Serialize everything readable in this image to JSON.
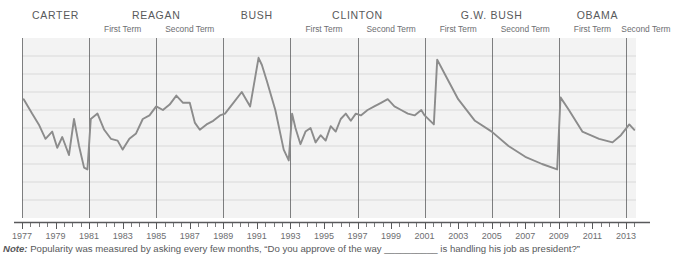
{
  "presidents": [
    {
      "name": "CARTER",
      "terms": []
    },
    {
      "name": "REAGAN",
      "terms": [
        "First Term",
        "Second Term"
      ]
    },
    {
      "name": "BUSH",
      "terms": []
    },
    {
      "name": "CLINTON",
      "terms": [
        "First Term",
        "Second Term"
      ]
    },
    {
      "name": "G.W. BUSH",
      "terms": [
        "First Term",
        "Second Term"
      ]
    },
    {
      "name": "OBAMA",
      "terms": [
        "First Term",
        "Second Term"
      ]
    }
  ],
  "note": {
    "label": "Note:",
    "text": "Popularity was measured by asking every few months, “Do you approve of the way __________ is handling his job as president?”"
  },
  "colors": {
    "line": "#8c8c8c",
    "plot_background": "#f3f3f3",
    "gridline": "#d9d9d9",
    "divider": "#58595b",
    "axis": "#58595b",
    "text": "#58595b"
  },
  "chart_data": {
    "type": "line",
    "title": "",
    "subtitle": "",
    "xlabel": "",
    "ylabel": "",
    "grid": true,
    "legend": "none",
    "xlim": [
      1977,
      2013.6
    ],
    "ylim": [
      0,
      100
    ],
    "xticks": [
      1977,
      1979,
      1981,
      1983,
      1985,
      1987,
      1989,
      1991,
      1993,
      1995,
      1997,
      1999,
      2001,
      2003,
      2005,
      2007,
      2009,
      2011,
      2013
    ],
    "xtick_labels": [
      "1977",
      "1979",
      "1981",
      "1983",
      "1985",
      "1987",
      "1989",
      "1991",
      "1993",
      "1995",
      "1997",
      "1999",
      "2001",
      "2003",
      "2005",
      "2007",
      "2009",
      "2011",
      "2013"
    ],
    "minor_tick_interval": 0.5,
    "term_boundaries": [
      1977,
      1981,
      1985,
      1989,
      1993,
      1997,
      2001,
      2005,
      2009,
      2013
    ],
    "series": [
      {
        "name": "Presidential approval rating",
        "x": [
          1977.1,
          1977.6,
          1978.0,
          1978.4,
          1978.8,
          1979.1,
          1979.4,
          1979.8,
          1980.1,
          1980.4,
          1980.7,
          1980.9,
          1981.1,
          1981.5,
          1981.9,
          1982.3,
          1982.7,
          1983.0,
          1983.4,
          1983.8,
          1984.2,
          1984.6,
          1985.0,
          1985.4,
          1985.8,
          1986.2,
          1986.6,
          1987.0,
          1987.3,
          1987.6,
          1988.0,
          1988.4,
          1988.8,
          1989.1,
          1989.6,
          1990.1,
          1990.6,
          1991.1,
          1991.3,
          1991.6,
          1992.1,
          1992.6,
          1992.9,
          1993.1,
          1993.3,
          1993.6,
          1993.9,
          1994.2,
          1994.5,
          1994.8,
          1995.1,
          1995.4,
          1995.7,
          1996.0,
          1996.3,
          1996.6,
          1996.9,
          1997.2,
          1997.6,
          1998.0,
          1998.4,
          1998.8,
          1999.2,
          1999.6,
          2000.0,
          2000.4,
          2000.8,
          2001.0,
          2001.55,
          2001.75,
          2002.2,
          2003.0,
          2004.0,
          2005.0,
          2006.0,
          2007.0,
          2008.0,
          2008.9,
          2009.1,
          2009.6,
          2010.4,
          2011.4,
          2012.2,
          2012.7,
          2013.2,
          2013.5
        ],
        "y": [
          66,
          58,
          52,
          44,
          48,
          39,
          45,
          35,
          55,
          40,
          28,
          27,
          55,
          58,
          49,
          44,
          43,
          38,
          44,
          47,
          55,
          57,
          62,
          60,
          63,
          68,
          64,
          64,
          53,
          49,
          52,
          54,
          57,
          58,
          64,
          70,
          62,
          89,
          85,
          76,
          60,
          38,
          32,
          58,
          50,
          41,
          48,
          50,
          42,
          46,
          43,
          51,
          48,
          55,
          58,
          54,
          58,
          57,
          60,
          62,
          64,
          66,
          62,
          60,
          58,
          57,
          60,
          57,
          52,
          88,
          80,
          66,
          54,
          48,
          40,
          34,
          30,
          27,
          67,
          60,
          48,
          44,
          42,
          46,
          52,
          49
        ]
      }
    ]
  }
}
